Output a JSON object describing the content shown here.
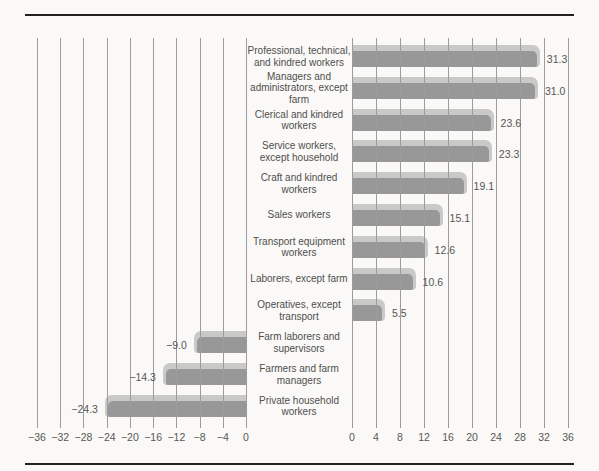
{
  "chart_data": {
    "type": "bar",
    "orientation": "horizontal",
    "diverging": true,
    "title": "",
    "xlabel": "",
    "ylabel": "",
    "legend": "none",
    "grid": "vertical",
    "axis": {
      "min": -36,
      "max": 36,
      "step": 4,
      "left_tick_values": [
        -36,
        -32,
        -28,
        -24,
        -20,
        -16,
        -12,
        -8,
        -4,
        0
      ],
      "left_tick_labels": [
        "−36",
        "−32",
        "−28",
        "−24",
        "−20",
        "−16",
        "−12",
        "−8",
        "−4",
        "0"
      ],
      "right_tick_values": [
        0,
        4,
        8,
        12,
        16,
        20,
        24,
        28,
        32,
        36
      ],
      "right_tick_labels": [
        "0",
        "4",
        "8",
        "12",
        "16",
        "20",
        "24",
        "28",
        "32",
        "36"
      ]
    },
    "categories": [
      "Professional, technical,\nand kindred workers",
      "Managers and\nadministrators, except\nfarm",
      "Clerical and kindred\nworkers",
      "Service workers,\nexcept household",
      "Craft and kindred\nworkers",
      "Sales workers",
      "Transport equipment\nworkers",
      "Laborers, except farm",
      "Operatives, except\ntransport",
      "Farm laborers and\nsupervisors",
      "Farmers and farm\nmanagers",
      "Private household\nworkers"
    ],
    "values": [
      31.3,
      31.0,
      23.6,
      23.3,
      19.1,
      15.1,
      12.6,
      10.6,
      5.5,
      -9.0,
      -14.3,
      -24.3
    ],
    "value_labels": [
      "31.3",
      "31.0",
      "23.6",
      "23.3",
      "19.1",
      "15.1",
      "12.6",
      "10.6",
      "5.5",
      "−9.0",
      "−14.3",
      "−24.3"
    ],
    "colors": {
      "bar_front": "#989898",
      "bar_top": "#c9c9c7",
      "gridline": "#9c9c9c",
      "category_text": "#4f4f4d",
      "value_text": "#565654",
      "rule": "#222220",
      "background": "#faf9f7"
    }
  }
}
